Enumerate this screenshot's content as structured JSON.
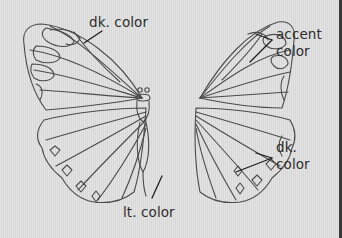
{
  "diagram": {
    "line_color": "#4a4a4a",
    "background_color": "#dedede",
    "labels": [
      {
        "id": "dk-color-top",
        "lines": [
          "dk. color"
        ],
        "target": "forewing outer band (left)"
      },
      {
        "id": "accent-color",
        "lines": [
          "accent",
          "color"
        ],
        "target": "forewing tip spots (right)"
      },
      {
        "id": "dk-color-right",
        "lines": [
          "dk.",
          "color"
        ],
        "target": "hindwing outer margin (right)"
      },
      {
        "id": "lt-color",
        "lines": [
          "lt. color"
        ],
        "target": "hindwing inner area"
      }
    ]
  }
}
